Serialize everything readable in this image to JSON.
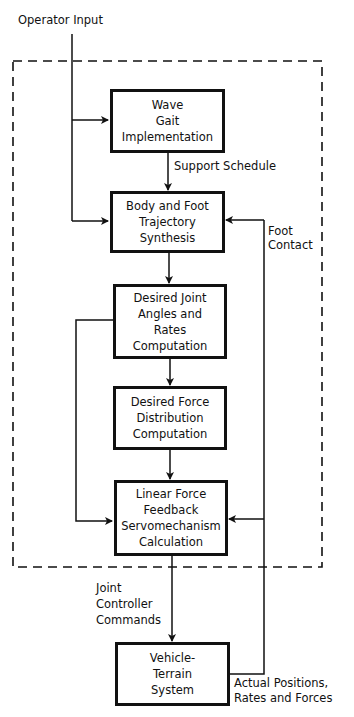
{
  "diagram": {
    "inputs": {
      "operator_input": "Operator Input"
    },
    "blocks": [
      {
        "id": "wave-gait",
        "lines": [
          "Wave",
          "Gait",
          "Implementation"
        ]
      },
      {
        "id": "body-foot-trajectory",
        "lines": [
          "Body and Foot",
          "Trajectory",
          "Synthesis"
        ]
      },
      {
        "id": "desired-joint-angles",
        "lines": [
          "Desired Joint",
          "Angles and",
          "Rates",
          "Computation"
        ]
      },
      {
        "id": "desired-force-distribution",
        "lines": [
          "Desired Force",
          "Distribution",
          "Computation"
        ]
      },
      {
        "id": "linear-force-feedback",
        "lines": [
          "Linear Force",
          "Feedback",
          "Servomechanism",
          "Calculation"
        ]
      },
      {
        "id": "vehicle-terrain",
        "lines": [
          "Vehicle-",
          "Terrain",
          "System"
        ]
      }
    ],
    "edge_labels": {
      "support_schedule": "Support Schedule",
      "foot_contact": [
        "Foot",
        "Contact"
      ],
      "joint_controller_commands": [
        "Joint",
        "Controller",
        "Commands"
      ],
      "actual_feedback": [
        "Actual Positions,",
        "Rates and Forces"
      ]
    }
  }
}
